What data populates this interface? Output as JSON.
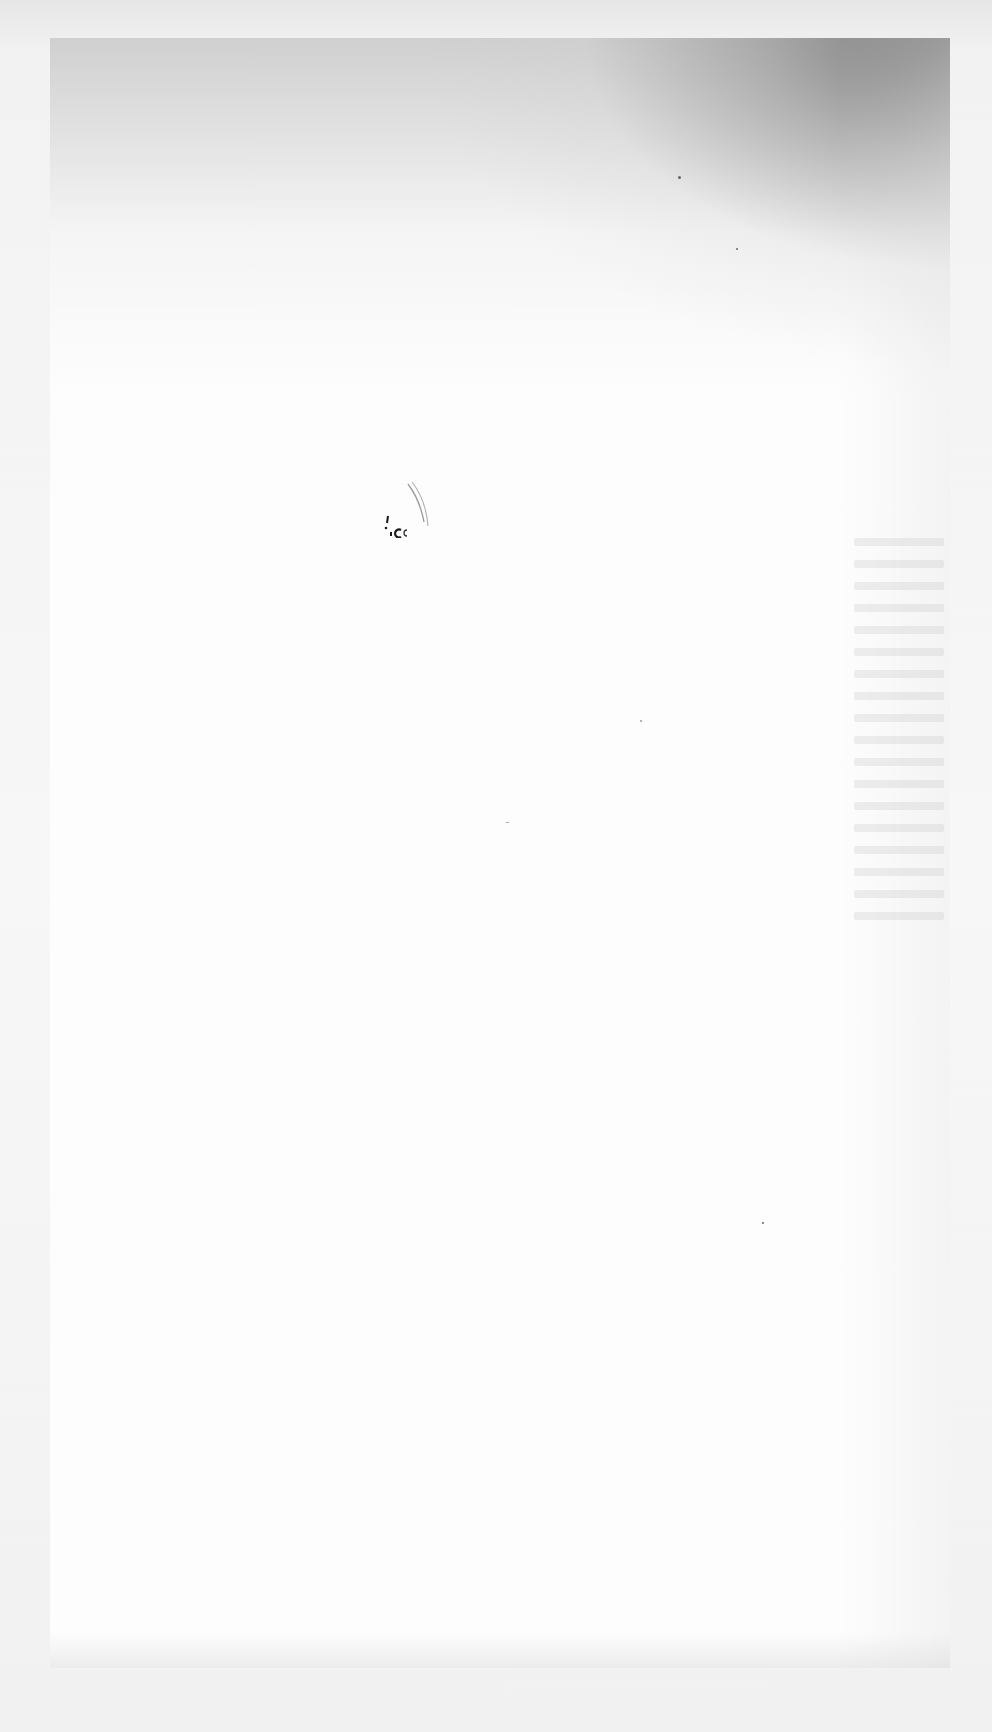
{
  "document": {
    "type": "scanned-blank-page",
    "text_content": "",
    "marks": [
      {
        "name": "handwritten-ink-mark",
        "approx_x": 365,
        "approx_y": 510
      },
      {
        "name": "dust-speck",
        "approx_x": 678,
        "approx_y": 176
      },
      {
        "name": "dust-speck",
        "approx_x": 736,
        "approx_y": 248
      },
      {
        "name": "dust-speck",
        "approx_x": 640,
        "approx_y": 720
      },
      {
        "name": "dust-speck",
        "approx_x": 762,
        "approx_y": 1222
      }
    ],
    "colors": {
      "paper": "#fdfdfd",
      "scan_border": "#ececec",
      "shadow": "#5a5a5a",
      "ink": "#1a1a1a"
    }
  }
}
